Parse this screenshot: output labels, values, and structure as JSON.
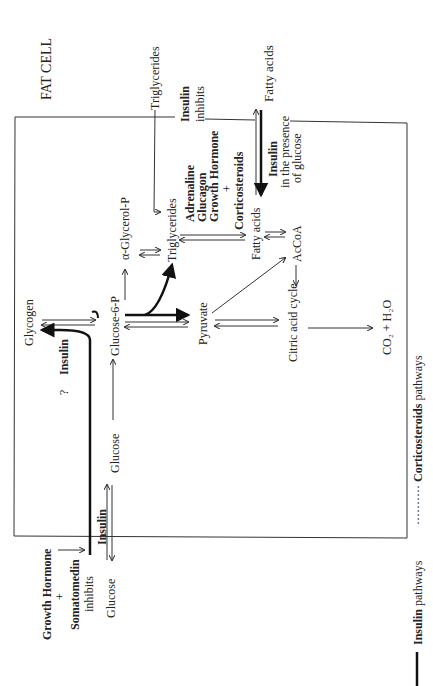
{
  "title": "FAT CELL",
  "nodes": {
    "triglycerides_ext": "Triglycerides",
    "fatty_acids_ext": "Fatty acids",
    "glucose_ext": "Glucose",
    "glucose_int": "Glucose",
    "glycogen": "Glycogen",
    "glucose6p": "Glucose-6-P",
    "alpha_glycerol_p": "α-Glycerol-P",
    "triglycerides_int": "Triglycerides",
    "pyruvate": "Pyruvate",
    "fatty_acids_int": "Fatty acids",
    "accoa": "AcCoA",
    "citric_acid_cycle": "Citric acid cycle",
    "co2_h2o": "CO₂ + H₂O"
  },
  "labels": {
    "insulin_inhibits_1": "Insulin",
    "insulin_inhibits_2": "inhibits",
    "hormones_1": "Adrenaline",
    "hormones_2": "Glucagon",
    "hormones_3": "Growth Hormone",
    "hormones_plus": "+",
    "hormones_4": "Corticosteroids",
    "insulin_glucose_1": "Insulin",
    "insulin_glucose_2": "in the presence",
    "insulin_glucose_3": "of glucose",
    "insulin_glycogen": "Insulin",
    "question": "?",
    "insulin_transport": "Insulin",
    "gh_1": "Growth  Hormone",
    "gh_plus": "+",
    "gh_2": "Somatomedin",
    "gh_3": "inhibits"
  },
  "legend": {
    "insulin_bold": "Insulin",
    "insulin_rest": " pathways",
    "cortico_dots": "··········",
    "cortico_bold": "Corticosteroids",
    "cortico_rest": " pathways"
  }
}
